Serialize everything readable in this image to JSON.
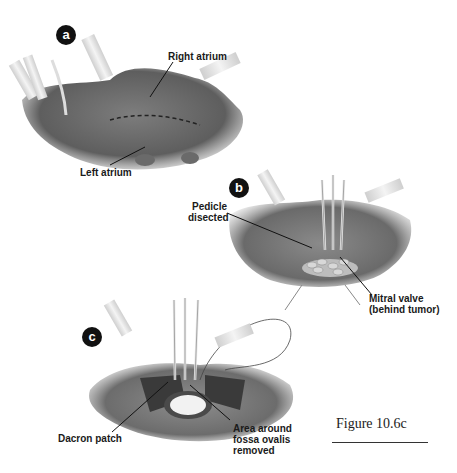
{
  "figure": {
    "caption": "Figure 10.6c",
    "panels": [
      {
        "id": "a",
        "badge": "a",
        "labels": [
          "Right atrium",
          "Left atrium"
        ]
      },
      {
        "id": "b",
        "badge": "b",
        "labels": [
          "Pedicle",
          "disected",
          "Mitral valve",
          "(behind tumor)"
        ]
      },
      {
        "id": "c",
        "badge": "c",
        "labels": [
          "Dacron patch",
          "Area around",
          "fossa ovalis",
          "removed"
        ]
      }
    ]
  },
  "colors": {
    "tissue_dark": "#5a5a5a",
    "tissue_mid": "#7a7a7a",
    "tissue_light": "#a8a8a8",
    "cannula": "#e6e6e6",
    "badge": "#111111",
    "text": "#1a1a1a"
  }
}
